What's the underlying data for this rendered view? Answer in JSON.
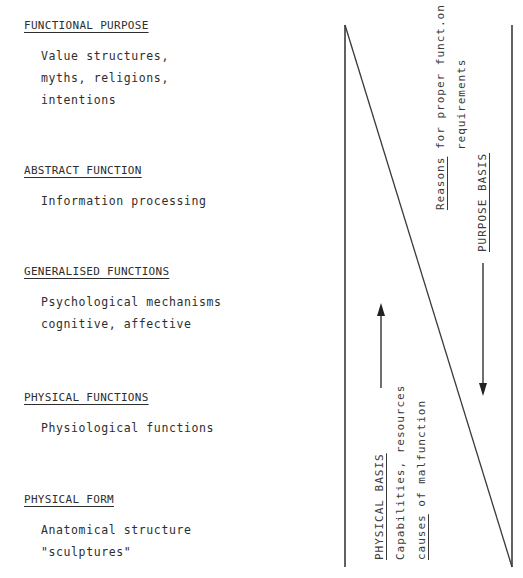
{
  "levels": [
    {
      "title": "FUNCTIONAL PURPOSE",
      "description": "Value structures,\nmyths, religions,\nintentions"
    },
    {
      "title": "ABSTRACT FUNCTION",
      "description": "Information processing"
    },
    {
      "title": "GENERALISED FUNCTIONS",
      "description": "Psychological mechanisms\ncognitive, affective"
    },
    {
      "title": "PHYSICAL FUNCTIONS",
      "description": "Physiological functions"
    },
    {
      "title": "PHYSICAL FORM",
      "description": "Anatomical structure\n\"sculptures\""
    }
  ],
  "purpose_side": {
    "line1_underlined": "Reasons",
    "line1_rest": " for proper funct.on",
    "line2": "requirements",
    "heading": "PURPOSE BASIS",
    "arrow_direction": "down"
  },
  "physical_side": {
    "heading": "PHYSICAL BASIS",
    "line1": "Capabilities, resources",
    "line2_underlined": "causes",
    "line2_rest": " of malfunction",
    "arrow_direction": "up"
  },
  "colors": {
    "ink": "#2e2e2e",
    "background": "#ffffff"
  }
}
